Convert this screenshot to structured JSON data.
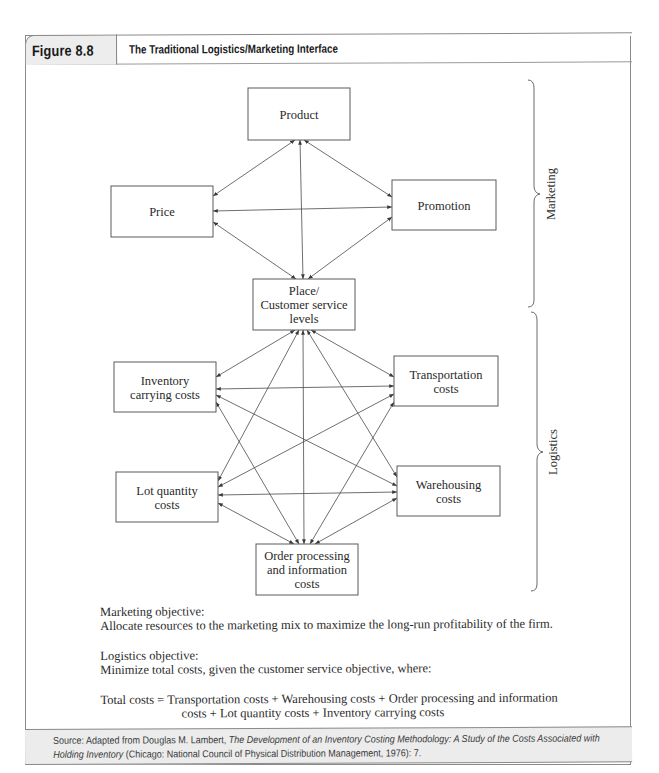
{
  "figure": {
    "number_label": "Figure 8.8",
    "title": "The Traditional Logistics/Marketing Interface"
  },
  "diagram": {
    "nodes": [
      {
        "id": "product",
        "lines": [
          "Product"
        ]
      },
      {
        "id": "price",
        "lines": [
          "Price"
        ]
      },
      {
        "id": "promotion",
        "lines": [
          "Promotion"
        ]
      },
      {
        "id": "place",
        "lines": [
          "Place/",
          "Customer service",
          "levels"
        ]
      },
      {
        "id": "inventory",
        "lines": [
          "Inventory",
          "carrying costs"
        ]
      },
      {
        "id": "transportation",
        "lines": [
          "Transportation",
          "costs"
        ]
      },
      {
        "id": "lot",
        "lines": [
          "Lot quantity",
          "costs"
        ]
      },
      {
        "id": "warehousing",
        "lines": [
          "Warehousing",
          "costs"
        ]
      },
      {
        "id": "order",
        "lines": [
          "Order processing",
          "and information",
          "costs"
        ]
      }
    ],
    "edges": [
      [
        "product",
        "price"
      ],
      [
        "product",
        "promotion"
      ],
      [
        "product",
        "place"
      ],
      [
        "price",
        "promotion"
      ],
      [
        "price",
        "place"
      ],
      [
        "promotion",
        "place"
      ],
      [
        "place",
        "inventory"
      ],
      [
        "place",
        "transportation"
      ],
      [
        "place",
        "lot"
      ],
      [
        "place",
        "warehousing"
      ],
      [
        "place",
        "order"
      ],
      [
        "inventory",
        "transportation"
      ],
      [
        "inventory",
        "warehousing"
      ],
      [
        "inventory",
        "order"
      ],
      [
        "transportation",
        "lot"
      ],
      [
        "transportation",
        "order"
      ],
      [
        "lot",
        "warehousing"
      ],
      [
        "lot",
        "order"
      ],
      [
        "warehousing",
        "order"
      ]
    ],
    "edge_style": "bidirectional-arrow",
    "groups": [
      {
        "label": "Marketing",
        "members": [
          "product",
          "price",
          "promotion",
          "place"
        ]
      },
      {
        "label": "Logistics",
        "members": [
          "place",
          "inventory",
          "transportation",
          "lot",
          "warehousing",
          "order"
        ]
      }
    ]
  },
  "notes": {
    "marketing_heading": "Marketing objective:",
    "marketing_text": "Allocate resources to the marketing mix to maximize the long-run profitability of the firm.",
    "logistics_heading": "Logistics objective:",
    "logistics_text": "Minimize total costs, given the customer service objective, where:",
    "total_line1": "Total costs = Transportation costs + Warehousing costs + Order processing and information",
    "total_line2": "costs + Lot quantity costs + Inventory carrying costs"
  },
  "source": {
    "prefix": "Source: Adapted from Douglas M. Lambert, ",
    "book_title": "The Development of an Inventory Costing Methodology: A Study of the Costs Associated with Holding Inventory",
    "suffix": " (Chicago: National Council of Physical Distribution Management, 1976): 7."
  }
}
